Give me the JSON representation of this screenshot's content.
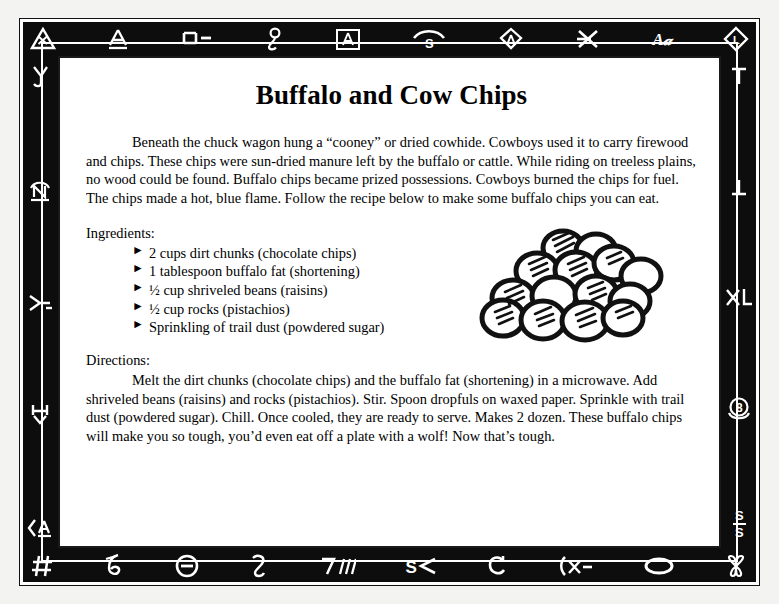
{
  "document": {
    "title": "Buffalo and Cow Chips",
    "intro": "Beneath the chuck wagon hung a “cooney” or dried cowhide. Cowboys used it to carry firewood and chips. These chips were sun-dried manure left by the buffalo or cattle. While riding on treeless plains, no wood could be found. Buffalo chips became prized possessions. Cowboys burned the chips for fuel. The chips made a hot, blue flame. Follow the recipe below to make some buffalo chips you can eat.",
    "ingredients_label": "Ingredients:",
    "ingredients": [
      {
        "bullet": "►",
        "text": "2 cups dirt chunks (chocolate chips)"
      },
      {
        "bullet": "►",
        "text": "1 tablespoon buffalo fat (shortening)"
      },
      {
        "bullet": "►",
        "text": "½ cup shriveled beans (raisins)"
      },
      {
        "bullet": "►",
        "text": "½ cup rocks (pistachios)"
      },
      {
        "bullet": "►",
        "text": "Sprinkling of trail dust (powdered sugar)"
      }
    ],
    "directions_label": "Directions:",
    "directions": "Melt the dirt chunks (chocolate chips) and the buffalo fat (shortening) in a microwave. Add shriveled beans (raisins) and rocks (pistachios). Stir. Spoon dropfuls on waxed paper. Sprinkle with trail dust (powdered sugar). Chill. Once cooled, they are ready to serve. Makes 2 dozen. These buffalo chips will make you so tough, you’d even eat off a plate with a wolf! Now that’s tough.",
    "illustration_name": "pile-of-buffalo-chips-cookies"
  },
  "border": {
    "frame_color": "#0d0d0d",
    "glyph_color": "#ffffff",
    "paper_color": "#ffffff",
    "page_background": "#f3f3f1",
    "top_brands": [
      {
        "name": "brand-triangle-x",
        "glyph": ""
      },
      {
        "name": "brand-a-bar",
        "glyph": "A"
      },
      {
        "name": "brand-e-dash",
        "glyph": "ш-"
      },
      {
        "name": "brand-curl-loop",
        "glyph": "٤"
      },
      {
        "name": "brand-boxed-a",
        "glyph": "A"
      },
      {
        "name": "brand-rafter-s",
        "glyph": "S"
      },
      {
        "name": "brand-diamond-a",
        "glyph": "A"
      },
      {
        "name": "brand-crossed-x",
        "glyph": "✕"
      },
      {
        "name": "brand-script-am",
        "glyph": "Aᵐ"
      },
      {
        "name": "brand-diamond-l",
        "glyph": "L"
      }
    ],
    "bottom_brands": [
      {
        "name": "brand-hash",
        "glyph": "#"
      },
      {
        "name": "brand-curl-b",
        "glyph": "б"
      },
      {
        "name": "brand-circle-dash",
        "glyph": "⊖"
      },
      {
        "name": "brand-curl-z",
        "glyph": "з"
      },
      {
        "name": "brand-seven-slashes",
        "glyph": "7///"
      },
      {
        "name": "brand-s-arrow",
        "glyph": "S≺"
      },
      {
        "name": "brand-c-hook",
        "glyph": "C"
      },
      {
        "name": "brand-paren-x-dash",
        "glyph": "(x-"
      },
      {
        "name": "brand-oval",
        "glyph": "⬭"
      },
      {
        "name": "brand-double-loop",
        "glyph": "œ"
      }
    ],
    "left_brands": [
      {
        "name": "brand-y-hook",
        "glyph": "Y"
      },
      {
        "name": "brand-n-bar",
        "glyph": "N"
      },
      {
        "name": "brand-lazy-y",
        "glyph": "⌐"
      },
      {
        "name": "brand-h-y",
        "glyph": "H"
      },
      {
        "name": "brand-arrow-a-bar",
        "glyph": "A"
      }
    ],
    "right_brands": [
      {
        "name": "brand-t",
        "glyph": "T"
      },
      {
        "name": "brand-lazy-t",
        "glyph": "T"
      },
      {
        "name": "brand-xl",
        "glyph": "XL"
      },
      {
        "name": "brand-circle-eight",
        "glyph": "8"
      },
      {
        "name": "brand-s-bar-s",
        "glyph": "S"
      }
    ]
  }
}
